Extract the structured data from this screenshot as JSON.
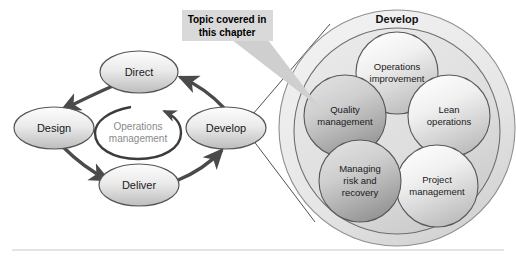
{
  "figure": {
    "background_color": "#ffffff",
    "rule_color": "#c9c9c9"
  },
  "callout": {
    "line1": "Topic covered in",
    "line2": "this chapter",
    "background_color": "#d9d9d9",
    "text_color": "#000000",
    "pointer_color": "#cfcfcf"
  },
  "cycle": {
    "center_label_line1": "Operations",
    "center_label_line2": "management",
    "center_fill": "#ffffff",
    "center_stroke": "#3c3c3c",
    "center_text_color": "#8a8a8a",
    "arrow_color": "#4a4a4a",
    "nodes": [
      {
        "id": "direct",
        "label": "Direct",
        "cx": 139,
        "cy": 72,
        "rx": 39,
        "ry": 21
      },
      {
        "id": "design",
        "label": "Design",
        "cx": 54,
        "cy": 128,
        "rx": 40,
        "ry": 21
      },
      {
        "id": "deliver",
        "label": "Deliver",
        "cx": 139,
        "cy": 185,
        "rx": 40,
        "ry": 21
      },
      {
        "id": "develop",
        "label": "Develop",
        "cx": 226,
        "cy": 128,
        "rx": 40,
        "ry": 21
      }
    ],
    "node_fill_top": "#f3f3f3",
    "node_fill_bottom": "#c4c4c4",
    "node_stroke": "#555555"
  },
  "magnified": {
    "title": "Develop",
    "outer_circle": {
      "cx": 397,
      "cy": 128,
      "r": 118,
      "fill": "#eaeaea",
      "stroke": "#8f8f8f"
    },
    "inner_circle": {
      "cx": 397,
      "cy": 130,
      "r": 103,
      "fill": "#e0e0e0",
      "stroke": "#6e6e6e"
    },
    "topics": [
      {
        "id": "operations-improvement",
        "line1": "Operations",
        "line2": "improvement",
        "line3": "",
        "cx": 397,
        "cy": 73,
        "r": 41,
        "highlighted": false
      },
      {
        "id": "quality-management",
        "line1": "Quality",
        "line2": "management",
        "line3": "",
        "cx": 345,
        "cy": 116,
        "r": 41,
        "highlighted": true
      },
      {
        "id": "lean-operations",
        "line1": "Lean",
        "line2": "operations",
        "line3": "",
        "cx": 449,
        "cy": 116,
        "r": 41,
        "highlighted": false
      },
      {
        "id": "managing-risk-and-recovery",
        "line1": "Managing",
        "line2": "risk and",
        "line3": "recovery",
        "cx": 360,
        "cy": 181,
        "r": 41,
        "highlighted": true
      },
      {
        "id": "project-management",
        "line1": "Project",
        "line2": "management",
        "line3": "",
        "cx": 437,
        "cy": 186,
        "r": 41,
        "highlighted": false
      }
    ],
    "topic_fill_normal_top": "#fbfbfb",
    "topic_fill_normal_bottom": "#c6c6c6",
    "topic_fill_highlight_top": "#d8d8d8",
    "topic_fill_highlight_bottom": "#9a9a9a",
    "topic_stroke": "#585858",
    "zoom_line_color": "#3c3c3c"
  }
}
